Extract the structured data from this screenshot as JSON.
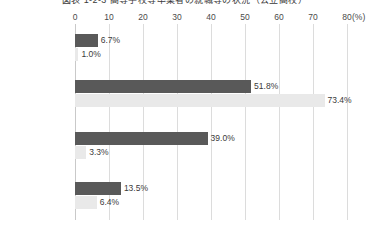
{
  "title": {
    "text": "図表 1-2-3 高等学校等卒業者の就職等の状況（公立高校）",
    "truncated": true
  },
  "axis": {
    "unit": "(%)",
    "ticks": [
      0,
      10,
      20,
      30,
      40,
      50,
      60,
      70,
      80
    ],
    "min": 0,
    "max": 80
  },
  "colors": {
    "series_dark": "#595959",
    "series_light": "#e9e9e9",
    "gridline": "#dcdcdc",
    "text": "#3a3a3a"
  },
  "chart_data": {
    "type": "bar",
    "orientation": "horizontal",
    "title": "図表 1-2-3 高等学校等卒業者の就職等の状況（公立高校）",
    "xlabel": "(%)",
    "ylabel": "",
    "xlim": [
      0,
      80
    ],
    "grid": true,
    "legend": "none",
    "categories": [
      "高校中退率",
      "大学等進学率",
      "就職者における\n非正規就職率",
      "進学も就職も\nしていない率"
    ],
    "series": [
      {
        "name": "series-1",
        "color": "#595959",
        "values": [
          6.7,
          51.8,
          39.0,
          13.5
        ],
        "labels": [
          "6.7%",
          "51.8%",
          "39.0%",
          "13.5%"
        ]
      },
      {
        "name": "series-2",
        "color": "#e9e9e9",
        "values": [
          1.0,
          73.4,
          3.3,
          6.4
        ],
        "labels": [
          "1.0%",
          "73.4%",
          "3.3%",
          "6.4%"
        ]
      }
    ]
  }
}
